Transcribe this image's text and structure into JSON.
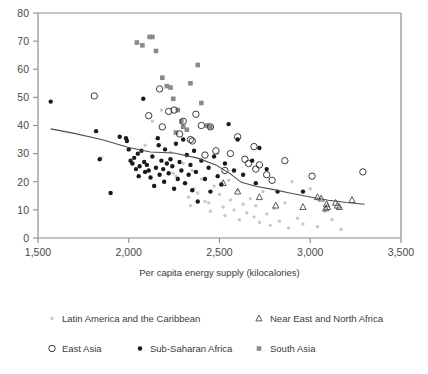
{
  "chart_data": {
    "type": "scatter",
    "title": "",
    "xlabel": "Per capita energy supply (kilocalories)",
    "ylabel": "",
    "xlim": [
      1500,
      3500
    ],
    "ylim": [
      0,
      80
    ],
    "xticks": [
      "1,500",
      "2,000",
      "2,500",
      "3,000",
      "3,500"
    ],
    "xtick_values": [
      1500,
      2000,
      2500,
      3000,
      3500
    ],
    "yticks": [
      "0",
      "10",
      "20",
      "30",
      "40",
      "50",
      "60",
      "70",
      "80"
    ],
    "ytick_values": [
      0,
      10,
      20,
      30,
      40,
      50,
      60,
      70,
      80
    ],
    "grid": false,
    "legend_position": "bottom",
    "series": [
      {
        "name": "Latin America and the Caribbean",
        "marker": "small-dot",
        "color": "#c8c8c8",
        "points": [
          [
            1850,
            28.5
          ],
          [
            2090,
            33.0
          ],
          [
            2130,
            41.5
          ],
          [
            2180,
            45.5
          ],
          [
            2230,
            30.5
          ],
          [
            2245,
            23.0
          ],
          [
            2260,
            22.0
          ],
          [
            2270,
            21.5
          ],
          [
            2300,
            26.5
          ],
          [
            2310,
            19.5
          ],
          [
            2330,
            14.5
          ],
          [
            2340,
            11.5
          ],
          [
            2350,
            24.0
          ],
          [
            2360,
            17.5
          ],
          [
            2380,
            16.0
          ],
          [
            2400,
            21.0
          ],
          [
            2420,
            13.0
          ],
          [
            2440,
            12.5
          ],
          [
            2450,
            9.5
          ],
          [
            2470,
            18.5
          ],
          [
            2490,
            30.0
          ],
          [
            2500,
            15.5
          ],
          [
            2520,
            11.0
          ],
          [
            2530,
            8.0
          ],
          [
            2550,
            20.5
          ],
          [
            2560,
            13.5
          ],
          [
            2580,
            10.0
          ],
          [
            2600,
            17.0
          ],
          [
            2610,
            6.5
          ],
          [
            2630,
            12.0
          ],
          [
            2650,
            9.0
          ],
          [
            2670,
            14.0
          ],
          [
            2690,
            7.5
          ],
          [
            2700,
            11.5
          ],
          [
            2720,
            5.5
          ],
          [
            2740,
            16.5
          ],
          [
            2760,
            8.5
          ],
          [
            2780,
            4.5
          ],
          [
            2800,
            10.5
          ],
          [
            2830,
            6.0
          ],
          [
            2860,
            12.5
          ],
          [
            2880,
            3.5
          ],
          [
            2900,
            20.0
          ],
          [
            2930,
            7.0
          ],
          [
            2960,
            5.0
          ],
          [
            3000,
            17.5
          ],
          [
            3040,
            4.0
          ],
          [
            3080,
            9.5
          ],
          [
            3120,
            6.5
          ],
          [
            3170,
            3.0
          ]
        ]
      },
      {
        "name": "Near East and North Africa",
        "marker": "open-triangle",
        "color": "#5a5a5a",
        "points": [
          [
            2520,
            19.5
          ],
          [
            2600,
            16.5
          ],
          [
            2720,
            14.5
          ],
          [
            2810,
            11.5
          ],
          [
            2960,
            11.0
          ],
          [
            3040,
            14.5
          ],
          [
            3060,
            14.0
          ],
          [
            3085,
            10.5
          ],
          [
            3090,
            12.0
          ],
          [
            3095,
            11.0
          ],
          [
            3140,
            12.5
          ],
          [
            3150,
            11.5
          ],
          [
            3160,
            11.0
          ],
          [
            3230,
            13.5
          ]
        ]
      },
      {
        "name": "East Asia",
        "marker": "open-circle",
        "color": "#3b3b3b",
        "points": [
          [
            1810,
            50.5
          ],
          [
            2110,
            43.5
          ],
          [
            2170,
            53.0
          ],
          [
            2185,
            39.5
          ],
          [
            2220,
            45.0
          ],
          [
            2250,
            45.5
          ],
          [
            2280,
            37.0
          ],
          [
            2300,
            41.5
          ],
          [
            2340,
            35.0
          ],
          [
            2350,
            34.5
          ],
          [
            2370,
            44.0
          ],
          [
            2400,
            40.0
          ],
          [
            2420,
            29.5
          ],
          [
            2450,
            39.5
          ],
          [
            2480,
            31.0
          ],
          [
            2530,
            24.0
          ],
          [
            2560,
            30.0
          ],
          [
            2600,
            36.0
          ],
          [
            2640,
            28.0
          ],
          [
            2660,
            26.5
          ],
          [
            2690,
            32.5
          ],
          [
            2700,
            24.5
          ],
          [
            2720,
            26.0
          ],
          [
            2760,
            22.5
          ],
          [
            2790,
            20.5
          ],
          [
            2860,
            27.5
          ],
          [
            3010,
            22.0
          ],
          [
            3290,
            23.5
          ]
        ]
      },
      {
        "name": "Sub-Saharan Africa",
        "marker": "filled-dot",
        "color": "#1a1a1a",
        "points": [
          [
            1570,
            48.5
          ],
          [
            1820,
            38.0
          ],
          [
            1840,
            28.0
          ],
          [
            1900,
            16.0
          ],
          [
            1950,
            36.0
          ],
          [
            1985,
            35.5
          ],
          [
            1990,
            34.5
          ],
          [
            2000,
            31.5
          ],
          [
            2010,
            27.5
          ],
          [
            2020,
            26.5
          ],
          [
            2030,
            28.5
          ],
          [
            2040,
            24.5
          ],
          [
            2050,
            30.0
          ],
          [
            2055,
            22.0
          ],
          [
            2060,
            25.5
          ],
          [
            2070,
            31.0
          ],
          [
            2080,
            49.5
          ],
          [
            2085,
            27.0
          ],
          [
            2090,
            23.5
          ],
          [
            2100,
            26.0
          ],
          [
            2110,
            24.0
          ],
          [
            2120,
            21.5
          ],
          [
            2130,
            29.0
          ],
          [
            2140,
            18.5
          ],
          [
            2150,
            25.0
          ],
          [
            2160,
            35.5
          ],
          [
            2165,
            33.0
          ],
          [
            2170,
            22.5
          ],
          [
            2180,
            27.5
          ],
          [
            2190,
            24.5
          ],
          [
            2195,
            20.0
          ],
          [
            2200,
            31.5
          ],
          [
            2210,
            26.5
          ],
          [
            2220,
            23.0
          ],
          [
            2230,
            28.0
          ],
          [
            2240,
            25.5
          ],
          [
            2250,
            17.5
          ],
          [
            2260,
            33.5
          ],
          [
            2270,
            21.0
          ],
          [
            2280,
            27.0
          ],
          [
            2290,
            24.0
          ],
          [
            2300,
            35.0
          ],
          [
            2310,
            19.5
          ],
          [
            2320,
            29.5
          ],
          [
            2330,
            22.5
          ],
          [
            2340,
            26.0
          ],
          [
            2350,
            17.0
          ],
          [
            2360,
            31.0
          ],
          [
            2370,
            23.5
          ],
          [
            2380,
            13.0
          ],
          [
            2400,
            27.5
          ],
          [
            2420,
            21.0
          ],
          [
            2440,
            25.0
          ],
          [
            2450,
            16.5
          ],
          [
            2470,
            29.0
          ],
          [
            2490,
            22.0
          ],
          [
            2510,
            19.0
          ],
          [
            2530,
            26.5
          ],
          [
            2550,
            40.5
          ],
          [
            2580,
            24.0
          ],
          [
            2600,
            35.0
          ],
          [
            2630,
            22.5
          ],
          [
            2680,
            27.5
          ],
          [
            2700,
            19.5
          ],
          [
            2720,
            32.0
          ],
          [
            2760,
            24.5
          ],
          [
            2820,
            16.5
          ],
          [
            2960,
            16.5
          ]
        ]
      },
      {
        "name": "South Asia",
        "marker": "filled-square",
        "color": "#8a8a8a",
        "points": [
          [
            2045,
            69.5
          ],
          [
            2075,
            68.5
          ],
          [
            2115,
            71.5
          ],
          [
            2130,
            71.5
          ],
          [
            2150,
            66.5
          ],
          [
            2185,
            57.0
          ],
          [
            2210,
            54.0
          ],
          [
            2230,
            53.5
          ],
          [
            2245,
            49.5
          ],
          [
            2270,
            45.5
          ],
          [
            2290,
            41.5
          ],
          [
            2300,
            39.5
          ],
          [
            2320,
            38.5
          ],
          [
            2340,
            55.0
          ],
          [
            2380,
            61.5
          ],
          [
            2400,
            48.0
          ],
          [
            2430,
            40.0
          ],
          [
            2450,
            39.5
          ],
          [
            2260,
            37.5
          ]
        ]
      }
    ],
    "trend_line": {
      "name": "fitted-trend",
      "points": [
        [
          1570,
          38.8
        ],
        [
          1700,
          37.2
        ],
        [
          1850,
          35.0
        ],
        [
          2000,
          32.2
        ],
        [
          2120,
          30.6
        ],
        [
          2250,
          30.2
        ],
        [
          2380,
          28.4
        ],
        [
          2480,
          26.0
        ],
        [
          2560,
          22.8
        ],
        [
          2620,
          19.8
        ],
        [
          2700,
          18.4
        ],
        [
          2800,
          17.2
        ],
        [
          2900,
          15.8
        ],
        [
          3000,
          14.6
        ],
        [
          3100,
          13.4
        ],
        [
          3200,
          12.6
        ],
        [
          3300,
          12.0
        ]
      ]
    }
  },
  "legend": {
    "items": [
      {
        "label": "Latin America and the Caribbean",
        "marker": "small-dot",
        "color": "#c8c8c8"
      },
      {
        "label": "Near East and North Africa",
        "marker": "open-triangle",
        "color": "#5a5a5a"
      },
      {
        "label": "East Asia",
        "marker": "open-circle",
        "color": "#3b3b3b"
      },
      {
        "label": "Sub-Saharan Africa",
        "marker": "filled-dot",
        "color": "#1a1a1a"
      },
      {
        "label": "South Asia",
        "marker": "filled-square",
        "color": "#8a8a8a"
      }
    ]
  }
}
